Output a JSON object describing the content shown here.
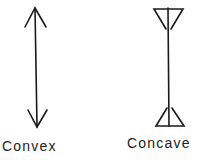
{
  "diagram": {
    "stroke_color": "#1a1a1a",
    "figures": [
      {
        "id": "convex",
        "label": "Convex",
        "shape": "double-headed arrow with outward-pointing heads"
      },
      {
        "id": "concave",
        "label": "Concave",
        "shape": "line with inward-pointing (reversed) arrowheads at both ends"
      }
    ]
  }
}
